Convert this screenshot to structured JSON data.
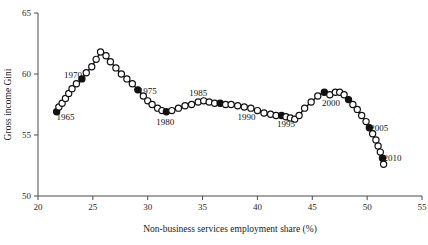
{
  "chart_data": {
    "type": "line",
    "title": "",
    "subtitle": "",
    "xlabel": "Non-business services employment share (%)",
    "ylabel": "Gross income Gini",
    "xlim": [
      20,
      55
    ],
    "ylim": [
      50,
      65
    ],
    "xticks": [
      20,
      25,
      30,
      35,
      40,
      45,
      50,
      55
    ],
    "xticklabels": [
      "20",
      "25",
      "30",
      "35",
      "40",
      "45",
      "50",
      "55"
    ],
    "yticks": [
      50,
      55,
      60,
      65
    ],
    "yticklabels": [
      "50",
      "55",
      "60",
      "65"
    ],
    "grid": false,
    "legend": false,
    "legend_position": "none",
    "marker_open": "hollow-circle",
    "marker_filled": "solid-circle",
    "marker_filled_meaning": "labelled five-year milestone years",
    "series": [
      {
        "name": "Gross income Gini vs non-business services employment share",
        "x": [
          21.7,
          21.9,
          22.2,
          22.5,
          22.8,
          23.1,
          23.5,
          24.0,
          24.4,
          24.9,
          25.3,
          25.7,
          26.2,
          26.6,
          27.1,
          27.6,
          28.1,
          28.6,
          29.1,
          29.6,
          30.0,
          30.4,
          30.9,
          31.3,
          31.7,
          32.2,
          32.8,
          33.4,
          34.0,
          34.6,
          35.1,
          35.6,
          36.1,
          36.6,
          37.1,
          37.6,
          38.2,
          38.8,
          39.4,
          40.0,
          40.6,
          41.2,
          41.7,
          42.2,
          42.6,
          43.0,
          43.4,
          43.8,
          44.3,
          44.9,
          45.5,
          46.1,
          46.6,
          47.1,
          47.5,
          47.9,
          48.3,
          48.7,
          49.1,
          49.5,
          49.9,
          50.2,
          50.5,
          50.8,
          51.0,
          51.2,
          51.4,
          51.5
        ],
        "y": [
          56.9,
          57.3,
          57.6,
          58.0,
          58.4,
          58.8,
          59.2,
          59.6,
          60.1,
          60.6,
          61.2,
          61.8,
          61.5,
          61.0,
          60.5,
          60.0,
          59.6,
          59.2,
          58.7,
          58.2,
          57.8,
          57.5,
          57.2,
          57.0,
          56.9,
          57.0,
          57.2,
          57.4,
          57.5,
          57.7,
          57.8,
          57.7,
          57.6,
          57.6,
          57.5,
          57.5,
          57.4,
          57.3,
          57.2,
          57.0,
          56.8,
          56.7,
          56.6,
          56.6,
          56.5,
          56.4,
          56.3,
          56.6,
          57.2,
          57.7,
          58.2,
          58.5,
          58.3,
          58.5,
          58.5,
          58.3,
          57.9,
          57.5,
          57.1,
          56.6,
          56.1,
          55.6,
          55.1,
          54.6,
          54.1,
          53.6,
          53.1,
          52.6
        ],
        "filled_indices": [
          0,
          7,
          18,
          24,
          33,
          43,
          51,
          56,
          61,
          66
        ]
      }
    ],
    "annotations": [
      {
        "label": "1965",
        "x": 22.5,
        "y": 56.5,
        "point_x": 21.7,
        "point_y": 56.9
      },
      {
        "label": "1970",
        "x": 23.2,
        "y": 59.9,
        "point_x": 24.0,
        "point_y": 59.6
      },
      {
        "label": "1975",
        "x": 30.0,
        "y": 58.6,
        "point_x": 29.1,
        "point_y": 58.7
      },
      {
        "label": "1980",
        "x": 31.6,
        "y": 56.1,
        "point_x": 31.7,
        "point_y": 56.9
      },
      {
        "label": "1985",
        "x": 34.6,
        "y": 58.5,
        "point_x": 36.6,
        "point_y": 57.6
      },
      {
        "label": "1990",
        "x": 39.0,
        "y": 56.5,
        "point_x": 40.0,
        "point_y": 57.0
      },
      {
        "label": "1995",
        "x": 42.6,
        "y": 55.9,
        "point_x": 43.4,
        "point_y": 56.3
      },
      {
        "label": "2000",
        "x": 46.7,
        "y": 57.6,
        "point_x": 47.5,
        "point_y": 58.5
      },
      {
        "label": "2005",
        "x": 51.1,
        "y": 55.6,
        "point_x": 50.2,
        "point_y": 55.6
      },
      {
        "label": "2010",
        "x": 52.3,
        "y": 53.1,
        "point_x": 51.4,
        "point_y": 53.1
      }
    ]
  }
}
